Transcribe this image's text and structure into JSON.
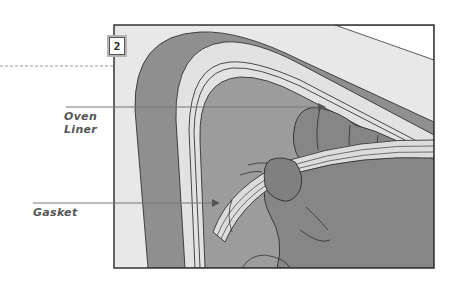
{
  "figure": {
    "step_number": "2",
    "labels": [
      {
        "id": "oven-liner",
        "lines": [
          "Oven",
          "Liner"
        ]
      },
      {
        "id": "gasket",
        "lines": [
          "Gasket"
        ]
      }
    ]
  },
  "colors": {
    "frame_border": "#333333",
    "light_panel": "#e6e6e6",
    "door_dark": "#8c8c8c",
    "liner_gray": "#9a9a9a",
    "hand_gray": "#858585",
    "gasket_light": "#d9d9d9",
    "label_text": "#555555",
    "pointer_line": "#777777"
  }
}
